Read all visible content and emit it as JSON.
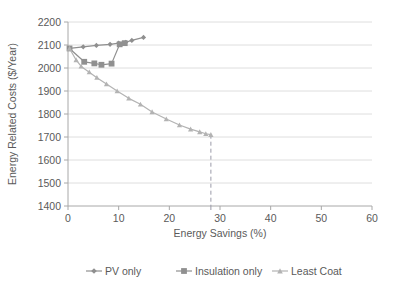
{
  "chart_data": {
    "type": "line",
    "title": "",
    "xlabel": "Energy Savings (%)",
    "ylabel": "Energy Related Costs ($/Year)",
    "xlim": [
      0,
      60
    ],
    "ylim": [
      1400,
      2200
    ],
    "xticks": [
      0,
      10,
      20,
      30,
      40,
      50,
      60
    ],
    "yticks": [
      1400,
      1500,
      1600,
      1700,
      1800,
      1900,
      2000,
      2100,
      2200
    ],
    "xtick_labels": [
      "0",
      "10",
      "20",
      "30",
      "40",
      "50",
      "60"
    ],
    "ytick_labels": [
      "1400",
      "1500",
      "1600",
      "1700",
      "1800",
      "1900",
      "2000",
      "2100",
      "2200"
    ],
    "grid": "horizontal",
    "legend_position": "bottom",
    "series": [
      {
        "name": "PV only",
        "marker": "diamond",
        "color": "#8f8f8f",
        "points": [
          {
            "x": 0.3,
            "y": 2085
          },
          {
            "x": 3.0,
            "y": 2092
          },
          {
            "x": 5.6,
            "y": 2098
          },
          {
            "x": 8.3,
            "y": 2103
          },
          {
            "x": 10.0,
            "y": 2108
          },
          {
            "x": 11.4,
            "y": 2112
          },
          {
            "x": 12.6,
            "y": 2120
          },
          {
            "x": 14.9,
            "y": 2133
          }
        ]
      },
      {
        "name": "Insulation only",
        "marker": "square",
        "color": "#909090",
        "points": [
          {
            "x": 0.3,
            "y": 2085
          },
          {
            "x": 3.2,
            "y": 2027
          },
          {
            "x": 5.2,
            "y": 2020
          },
          {
            "x": 6.6,
            "y": 2014
          },
          {
            "x": 8.6,
            "y": 2019
          },
          {
            "x": 10.2,
            "y": 2103
          },
          {
            "x": 11.2,
            "y": 2108
          }
        ]
      },
      {
        "name": "Least Coat",
        "marker": "triangle",
        "color": "#b3b3b3",
        "points": [
          {
            "x": 0.3,
            "y": 2085
          },
          {
            "x": 1.6,
            "y": 2035
          },
          {
            "x": 2.6,
            "y": 2007
          },
          {
            "x": 4.2,
            "y": 1982
          },
          {
            "x": 5.7,
            "y": 1958
          },
          {
            "x": 7.6,
            "y": 1930
          },
          {
            "x": 9.7,
            "y": 1900
          },
          {
            "x": 12.0,
            "y": 1868
          },
          {
            "x": 14.3,
            "y": 1842
          },
          {
            "x": 16.6,
            "y": 1809
          },
          {
            "x": 19.4,
            "y": 1778
          },
          {
            "x": 22.0,
            "y": 1752
          },
          {
            "x": 24.2,
            "y": 1734
          },
          {
            "x": 26.0,
            "y": 1722
          },
          {
            "x": 27.2,
            "y": 1714
          },
          {
            "x": 28.2,
            "y": 1710
          }
        ]
      }
    ],
    "annotations": [
      {
        "type": "dropline",
        "style": "dashed",
        "color": "#9a9aa8",
        "x": 28.2,
        "y_from": 1710,
        "y_to": 1400
      }
    ],
    "legend": [
      {
        "label": "PV only",
        "marker": "diamond",
        "color": "#8f8f8f"
      },
      {
        "label": "Insulation only",
        "marker": "square",
        "color": "#909090"
      },
      {
        "label": "Least Coat",
        "marker": "triangle",
        "color": "#b3b3b3"
      }
    ]
  }
}
